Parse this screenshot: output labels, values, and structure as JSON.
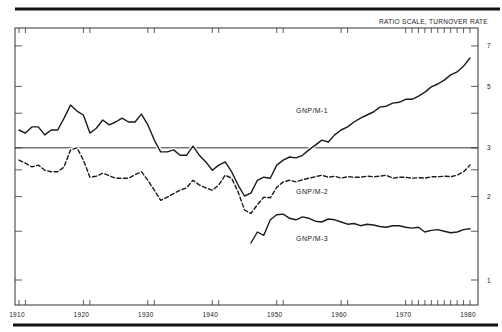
{
  "chart_data": {
    "type": "line",
    "title": "",
    "scale_note": "RATIO SCALE, TURNOVER RATE",
    "xlabel": "",
    "ylabel": "Turnover rate (ratio scale)",
    "y_scale": "log",
    "xlim": [
      1910,
      1980
    ],
    "ylim": [
      1,
      7.5
    ],
    "x_ticks": [
      1910,
      1920,
      1930,
      1940,
      1950,
      1960,
      1970,
      1980
    ],
    "x_tick_labels": [
      "1910",
      "1920",
      "1930",
      "1940",
      "1950",
      "1960",
      "1970",
      "1980"
    ],
    "y_ticks": [
      1,
      1.5,
      2,
      2.5,
      3,
      4,
      5,
      7
    ],
    "y_tick_labels": {
      "1": "1",
      "2": "2",
      "3": "3",
      "5": "5",
      "7": "7"
    },
    "reference_line": {
      "value": 3,
      "style": "solid horizontal"
    },
    "grid": false,
    "legend": "inline labels",
    "series": [
      {
        "name": "GNP/M-1",
        "style": "solid",
        "label_pos": {
          "x": 1953,
          "y": 4.0
        },
        "x": [
          1910,
          1911,
          1912,
          1913,
          1914,
          1915,
          1916,
          1917,
          1918,
          1919,
          1920,
          1921,
          1922,
          1923,
          1924,
          1925,
          1926,
          1927,
          1928,
          1929,
          1930,
          1931,
          1932,
          1933,
          1934,
          1935,
          1936,
          1937,
          1938,
          1939,
          1940,
          1941,
          1942,
          1943,
          1944,
          1945,
          1946,
          1947,
          1948,
          1949,
          1950,
          1951,
          1952,
          1953,
          1954,
          1955,
          1956,
          1957,
          1958,
          1959,
          1960,
          1961,
          1962,
          1963,
          1964,
          1965,
          1966,
          1967,
          1968,
          1969,
          1970,
          1971,
          1972,
          1973,
          1974,
          1975,
          1976,
          1977,
          1978,
          1979,
          1980
        ],
        "values": [
          3.48,
          3.39,
          3.57,
          3.57,
          3.34,
          3.48,
          3.48,
          3.84,
          4.28,
          4.07,
          3.94,
          3.39,
          3.53,
          3.78,
          3.63,
          3.72,
          3.84,
          3.72,
          3.72,
          3.97,
          3.63,
          3.2,
          2.9,
          2.9,
          2.95,
          2.82,
          2.82,
          3.04,
          2.82,
          2.67,
          2.49,
          2.6,
          2.67,
          2.46,
          2.2,
          2.01,
          2.06,
          2.29,
          2.35,
          2.33,
          2.6,
          2.71,
          2.78,
          2.76,
          2.82,
          2.95,
          3.07,
          3.2,
          3.15,
          3.34,
          3.48,
          3.57,
          3.72,
          3.84,
          3.94,
          4.04,
          4.21,
          4.24,
          4.35,
          4.38,
          4.49,
          4.49,
          4.61,
          4.77,
          4.98,
          5.1,
          5.27,
          5.5,
          5.64,
          5.92,
          6.33
        ]
      },
      {
        "name": "GNP/M-2",
        "style": "dashed",
        "label_pos": {
          "x": 1953,
          "y": 2.05
        },
        "x": [
          1910,
          1911,
          1912,
          1913,
          1914,
          1915,
          1916,
          1917,
          1918,
          1919,
          1920,
          1921,
          1922,
          1923,
          1924,
          1925,
          1926,
          1927,
          1928,
          1929,
          1930,
          1931,
          1932,
          1933,
          1934,
          1935,
          1936,
          1937,
          1938,
          1939,
          1940,
          1941,
          1942,
          1943,
          1944,
          1945,
          1946,
          1947,
          1948,
          1949,
          1950,
          1951,
          1952,
          1953,
          1954,
          1955,
          1956,
          1957,
          1958,
          1959,
          1960,
          1961,
          1962,
          1963,
          1964,
          1965,
          1966,
          1967,
          1968,
          1969,
          1970,
          1971,
          1972,
          1973,
          1974,
          1975,
          1976,
          1977,
          1978,
          1979,
          1980
        ],
        "values": [
          2.71,
          2.64,
          2.56,
          2.6,
          2.49,
          2.46,
          2.46,
          2.56,
          2.95,
          3.0,
          2.71,
          2.35,
          2.37,
          2.43,
          2.38,
          2.33,
          2.33,
          2.33,
          2.4,
          2.46,
          2.29,
          2.11,
          1.94,
          1.99,
          2.05,
          2.11,
          2.15,
          2.29,
          2.2,
          2.15,
          2.11,
          2.2,
          2.39,
          2.33,
          2.08,
          1.79,
          1.74,
          1.87,
          1.99,
          1.98,
          2.16,
          2.26,
          2.29,
          2.26,
          2.3,
          2.33,
          2.36,
          2.39,
          2.35,
          2.37,
          2.33,
          2.36,
          2.35,
          2.35,
          2.37,
          2.36,
          2.37,
          2.39,
          2.33,
          2.35,
          2.35,
          2.33,
          2.34,
          2.33,
          2.36,
          2.36,
          2.37,
          2.36,
          2.39,
          2.46,
          2.6
        ]
      },
      {
        "name": "GNP/M-3",
        "style": "solid",
        "label_pos": {
          "x": 1953,
          "y": 1.38
        },
        "x": [
          1946,
          1947,
          1948,
          1949,
          1950,
          1951,
          1952,
          1953,
          1954,
          1955,
          1956,
          1957,
          1958,
          1959,
          1960,
          1961,
          1962,
          1963,
          1964,
          1965,
          1966,
          1967,
          1968,
          1969,
          1970,
          1971,
          1972,
          1973,
          1974,
          1975,
          1976,
          1977,
          1978,
          1979,
          1980
        ],
        "values": [
          1.36,
          1.49,
          1.45,
          1.65,
          1.72,
          1.73,
          1.67,
          1.65,
          1.69,
          1.67,
          1.63,
          1.62,
          1.66,
          1.65,
          1.62,
          1.59,
          1.6,
          1.57,
          1.59,
          1.58,
          1.56,
          1.55,
          1.57,
          1.57,
          1.55,
          1.54,
          1.55,
          1.49,
          1.51,
          1.52,
          1.5,
          1.48,
          1.49,
          1.52,
          1.53
        ]
      }
    ]
  },
  "layout": {
    "plot": {
      "left": 15,
      "right": 478,
      "top": 28,
      "bottom": 305
    },
    "x_px": {
      "x0": 19,
      "x1": 470,
      "year0": 1910,
      "year1": 1980
    },
    "y_px": {
      "base": 280,
      "per_decade": 277
    },
    "colors": {
      "ink": "#1a1a1a",
      "frame": "#333333",
      "rule": "#111111"
    }
  }
}
